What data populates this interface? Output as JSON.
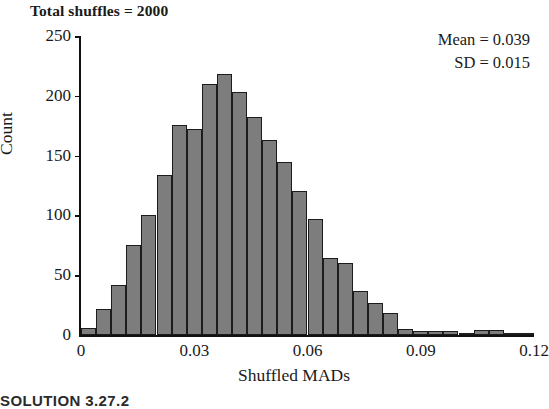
{
  "title": "Total shuffles = 2000",
  "annotations": {
    "mean_label": "Mean = 0.039",
    "sd_label": "SD = 0.015"
  },
  "footer": {
    "caption": "SOLUTION 3.27.2"
  },
  "colors": {
    "bar_fill": "#7d7d7d",
    "bar_border": "#1c1c1c",
    "axis": "#111111",
    "text": "#1a1a1a",
    "background": "#ffffff"
  },
  "chart_data": {
    "type": "bar",
    "title": "Total shuffles = 2000",
    "xlabel": "Shuffled MADs",
    "ylabel": "Count",
    "xlim": [
      0,
      0.12
    ],
    "ylim": [
      0,
      250
    ],
    "grid": false,
    "legend": "none",
    "bin_width": 0.004,
    "x_ticks": [
      0,
      0.03,
      0.06,
      0.09,
      0.12
    ],
    "x_tick_labels": [
      "0",
      "0.03",
      "0.06",
      "0.09",
      "0.12"
    ],
    "y_ticks": [
      0,
      50,
      100,
      150,
      200,
      250
    ],
    "y_tick_labels": [
      "0",
      "50",
      "100",
      "150",
      "200",
      "250"
    ],
    "annotations": [
      "Mean = 0.039",
      "SD = 0.015"
    ],
    "bin_starts": [
      0.0,
      0.004,
      0.008,
      0.012,
      0.016,
      0.02,
      0.024,
      0.028,
      0.032,
      0.036,
      0.04,
      0.044,
      0.048,
      0.052,
      0.056,
      0.06,
      0.064,
      0.068,
      0.072,
      0.076,
      0.08,
      0.084,
      0.088,
      0.092,
      0.096,
      0.1,
      0.104,
      0.108,
      0.112,
      0.116
    ],
    "bin_centers": [
      0.002,
      0.006,
      0.01,
      0.014,
      0.018,
      0.022,
      0.026,
      0.03,
      0.034,
      0.038,
      0.042,
      0.046,
      0.05,
      0.054,
      0.058,
      0.062,
      0.066,
      0.07,
      0.074,
      0.078,
      0.082,
      0.086,
      0.09,
      0.094,
      0.098,
      0.102,
      0.106,
      0.11,
      0.114,
      0.118
    ],
    "categories": [
      "0.002",
      "0.006",
      "0.010",
      "0.014",
      "0.018",
      "0.022",
      "0.026",
      "0.030",
      "0.034",
      "0.038",
      "0.042",
      "0.046",
      "0.050",
      "0.054",
      "0.058",
      "0.062",
      "0.066",
      "0.070",
      "0.074",
      "0.078",
      "0.082",
      "0.086",
      "0.090",
      "0.094",
      "0.098",
      "0.102",
      "0.106",
      "0.110",
      "0.114",
      "0.118"
    ],
    "values": [
      6,
      22,
      42,
      75,
      100,
      134,
      176,
      172,
      210,
      218,
      203,
      182,
      163,
      145,
      120,
      97,
      64,
      60,
      37,
      27,
      18,
      5,
      3,
      3,
      3,
      1,
      4,
      4,
      1,
      1
    ],
    "total_count": 2000,
    "mean": 0.039,
    "sd": 0.015
  }
}
